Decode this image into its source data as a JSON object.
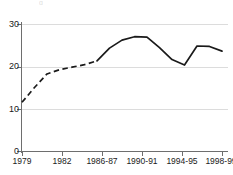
{
  "chart_data": {
    "type": "line",
    "title": "",
    "xlabel": "",
    "ylabel": "",
    "ylim": [
      0,
      30
    ],
    "yticks": [
      0,
      10,
      20,
      30
    ],
    "ytick_labels": [
      "0",
      "10",
      "20",
      "30"
    ],
    "grid": "horizontal",
    "legend": "none",
    "xtick_labels": [
      "1979",
      "1982",
      "1986-87",
      "1990-91",
      "1994-95",
      "1998-99"
    ],
    "x": [
      "1979",
      "1980",
      "1981",
      "1982",
      "1983",
      "1984-85",
      "1986-87",
      "1988-89",
      "1990-91",
      "1991-92",
      "1992-93",
      "1993-94",
      "1994-95",
      "1995-96",
      "1996-97",
      "1997-98",
      "1998-99"
    ],
    "values": [
      11.5,
      15.0,
      18.2,
      19.2,
      19.8,
      20.4,
      21.3,
      24.3,
      26.2,
      27.0,
      26.9,
      24.4,
      21.6,
      20.3,
      24.8,
      24.7,
      23.6
    ],
    "series": [
      {
        "name": "series-1",
        "color": "#1a1a1a",
        "estimated_segment": {
          "style": "dashed",
          "from_index": 0,
          "to_index": 6,
          "note": "dashed portion indicates estimated values"
        },
        "values": [
          11.5,
          15.0,
          18.2,
          19.2,
          19.8,
          20.4,
          21.3,
          24.3,
          26.2,
          27.0,
          26.9,
          24.4,
          21.6,
          20.3,
          24.8,
          24.7,
          23.6
        ]
      }
    ],
    "annotations": {
      "peak_value": 27.0,
      "peak_x": "1991-92",
      "min_value": 11.5,
      "min_x": "1979",
      "final_value": 23.6,
      "final_x": "1998-99"
    },
    "colors": {
      "line": "#1a1a1a",
      "grid": "#dcdcdc",
      "axis": "#6e6e6e",
      "background": "#ffffff",
      "text": "#1a1a1a"
    }
  },
  "title_remnant": "g"
}
